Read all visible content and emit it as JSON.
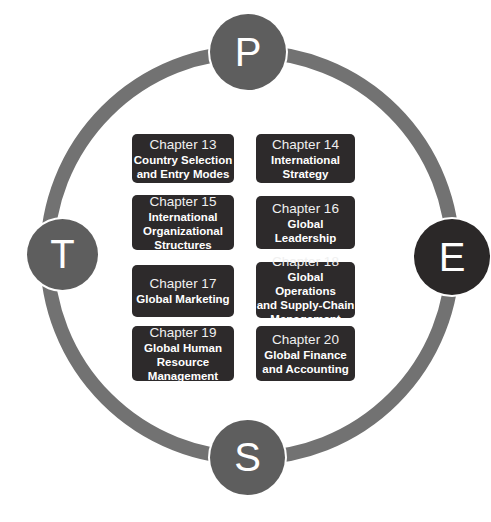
{
  "colors": {
    "ring": "#727272",
    "node_gray": "#5e5e5e",
    "node_dark": "#2b2828",
    "box": "#2d2a2b",
    "text": "#ffffff"
  },
  "nodes": [
    {
      "letter": "P",
      "position": "top"
    },
    {
      "letter": "T",
      "position": "left"
    },
    {
      "letter": "E",
      "position": "right"
    },
    {
      "letter": "S",
      "position": "bottom"
    }
  ],
  "chapters": [
    {
      "chapter": "Chapter 13",
      "title_lines": [
        "Country Selection",
        "and Entry Modes"
      ]
    },
    {
      "chapter": "Chapter 14",
      "title_lines": [
        "International",
        "Strategy"
      ]
    },
    {
      "chapter": "Chapter 15",
      "title_lines": [
        "International",
        "Organizational",
        "Structures"
      ]
    },
    {
      "chapter": "Chapter 16",
      "title_lines": [
        "Global Leadership"
      ]
    },
    {
      "chapter": "Chapter 17",
      "title_lines": [
        "Global Marketing"
      ]
    },
    {
      "chapter": "Chapter 18",
      "title_lines": [
        "Global Operations",
        "and Supply-Chain",
        "Management"
      ]
    },
    {
      "chapter": "Chapter 19",
      "title_lines": [
        "Global Human",
        "Resource",
        "Management"
      ]
    },
    {
      "chapter": "Chapter 20",
      "title_lines": [
        "Global Finance",
        "and Accounting"
      ]
    }
  ]
}
